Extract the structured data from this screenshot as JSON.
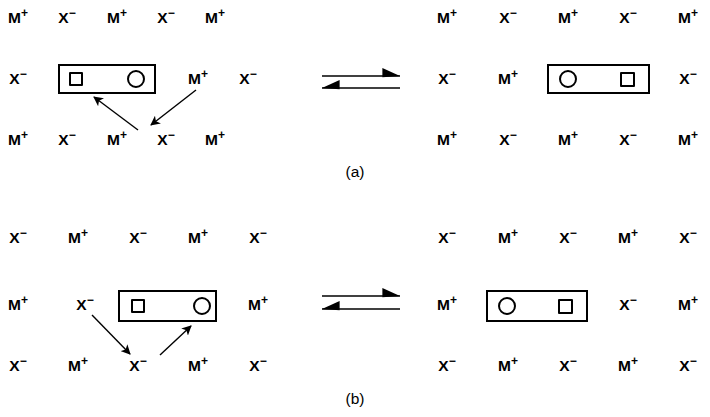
{
  "figure": {
    "background_color": "#ffffff",
    "ink_color": "#000000",
    "width": 710,
    "height": 417
  },
  "ions": {
    "cation": {
      "symbol": "M",
      "charge": "+",
      "label": "M+"
    },
    "anion": {
      "symbol": "X",
      "charge": "−",
      "label": "X−"
    }
  },
  "panels": [
    {
      "id": "a",
      "label": "(a)",
      "label_x": 355,
      "label_y": 172,
      "left_side": {
        "rows": [
          {
            "y": 18,
            "cells": [
              {
                "x": 18,
                "symbol": "M",
                "charge": "+"
              },
              {
                "x": 67,
                "symbol": "X",
                "charge": "−"
              },
              {
                "x": 117,
                "symbol": "M",
                "charge": "+"
              },
              {
                "x": 166,
                "symbol": "X",
                "charge": "−"
              },
              {
                "x": 215,
                "symbol": "M",
                "charge": "+"
              }
            ]
          },
          {
            "y": 79,
            "cells": [
              {
                "x": 18,
                "symbol": "X",
                "charge": "−"
              },
              {
                "x": 198,
                "symbol": "M",
                "charge": "+"
              },
              {
                "x": 248,
                "symbol": "X",
                "charge": "−"
              }
            ]
          },
          {
            "y": 140,
            "cells": [
              {
                "x": 18,
                "symbol": "M",
                "charge": "+"
              },
              {
                "x": 67,
                "symbol": "X",
                "charge": "−"
              },
              {
                "x": 117,
                "symbol": "M",
                "charge": "+"
              },
              {
                "x": 166,
                "symbol": "X",
                "charge": "−"
              },
              {
                "x": 215,
                "symbol": "M",
                "charge": "+"
              }
            ]
          }
        ],
        "host_box": {
          "x": 58,
          "y": 64,
          "w": 98,
          "h": 30
        },
        "guests": [
          {
            "shape": "square",
            "x": 69,
            "y": 72,
            "w": 14,
            "h": 14
          },
          {
            "shape": "circle",
            "x": 127,
            "y": 70,
            "w": 18,
            "h": 18
          }
        ],
        "arrows": [
          {
            "name": "cation-to-host-arrow",
            "x1": 138,
            "y1": 130,
            "x2": 94,
            "y2": 97
          },
          {
            "name": "cation-release-arrow",
            "x1": 196,
            "y1": 90,
            "x2": 151,
            "y2": 125
          }
        ]
      },
      "equilibrium_arrow": {
        "x": 322,
        "y_top": 76,
        "y_bottom": 88,
        "length": 78
      },
      "right_side": {
        "rows": [
          {
            "y": 18,
            "cells": [
              {
                "x": 447,
                "symbol": "M",
                "charge": "+"
              },
              {
                "x": 508,
                "symbol": "X",
                "charge": "−"
              },
              {
                "x": 568,
                "symbol": "M",
                "charge": "+"
              },
              {
                "x": 628,
                "symbol": "X",
                "charge": "−"
              },
              {
                "x": 688,
                "symbol": "M",
                "charge": "+"
              }
            ]
          },
          {
            "y": 79,
            "cells": [
              {
                "x": 447,
                "symbol": "X",
                "charge": "−"
              },
              {
                "x": 508,
                "symbol": "M",
                "charge": "+"
              },
              {
                "x": 688,
                "symbol": "X",
                "charge": "−"
              }
            ]
          },
          {
            "y": 140,
            "cells": [
              {
                "x": 447,
                "symbol": "M",
                "charge": "+"
              },
              {
                "x": 508,
                "symbol": "X",
                "charge": "−"
              },
              {
                "x": 568,
                "symbol": "M",
                "charge": "+"
              },
              {
                "x": 628,
                "symbol": "X",
                "charge": "−"
              },
              {
                "x": 688,
                "symbol": "M",
                "charge": "+"
              }
            ]
          }
        ],
        "host_box": {
          "x": 547,
          "y": 64,
          "w": 103,
          "h": 30
        },
        "guests": [
          {
            "shape": "circle",
            "x": 559,
            "y": 70,
            "w": 18,
            "h": 18
          },
          {
            "shape": "square",
            "x": 620,
            "y": 72,
            "w": 15,
            "h": 15
          }
        ],
        "arrows": []
      }
    },
    {
      "id": "b",
      "label": "(b)",
      "label_x": 355,
      "label_y": 399,
      "left_side": {
        "rows": [
          {
            "y": 238,
            "cells": [
              {
                "x": 18,
                "symbol": "X",
                "charge": "−"
              },
              {
                "x": 78,
                "symbol": "M",
                "charge": "+"
              },
              {
                "x": 138,
                "symbol": "X",
                "charge": "−"
              },
              {
                "x": 198,
                "symbol": "M",
                "charge": "+"
              },
              {
                "x": 258,
                "symbol": "X",
                "charge": "−"
              }
            ]
          },
          {
            "y": 305,
            "cells": [
              {
                "x": 18,
                "symbol": "M",
                "charge": "+"
              },
              {
                "x": 85,
                "symbol": "X",
                "charge": "−"
              },
              {
                "x": 258,
                "symbol": "M",
                "charge": "+"
              }
            ]
          },
          {
            "y": 366,
            "cells": [
              {
                "x": 18,
                "symbol": "X",
                "charge": "−"
              },
              {
                "x": 78,
                "symbol": "M",
                "charge": "+"
              },
              {
                "x": 138,
                "symbol": "X",
                "charge": "−"
              },
              {
                "x": 198,
                "symbol": "M",
                "charge": "+"
              },
              {
                "x": 258,
                "symbol": "X",
                "charge": "−"
              }
            ]
          }
        ],
        "host_box": {
          "x": 118,
          "y": 290,
          "w": 99,
          "h": 32
        },
        "guests": [
          {
            "shape": "square",
            "x": 131,
            "y": 299,
            "w": 14,
            "h": 14
          },
          {
            "shape": "circle",
            "x": 193,
            "y": 297,
            "w": 18,
            "h": 18
          }
        ],
        "arrows": [
          {
            "name": "anion-release-arrow",
            "x1": 92,
            "y1": 315,
            "x2": 130,
            "y2": 354
          },
          {
            "name": "anion-to-host-arrow",
            "x1": 160,
            "y1": 355,
            "x2": 191,
            "y2": 326
          }
        ]
      },
      "equilibrium_arrow": {
        "x": 322,
        "y_top": 296,
        "y_bottom": 309,
        "length": 78
      },
      "right_side": {
        "rows": [
          {
            "y": 238,
            "cells": [
              {
                "x": 447,
                "symbol": "X",
                "charge": "−"
              },
              {
                "x": 508,
                "symbol": "M",
                "charge": "+"
              },
              {
                "x": 568,
                "symbol": "X",
                "charge": "−"
              },
              {
                "x": 628,
                "symbol": "M",
                "charge": "+"
              },
              {
                "x": 688,
                "symbol": "X",
                "charge": "−"
              }
            ]
          },
          {
            "y": 305,
            "cells": [
              {
                "x": 447,
                "symbol": "M",
                "charge": "+"
              },
              {
                "x": 628,
                "symbol": "X",
                "charge": "−"
              },
              {
                "x": 688,
                "symbol": "M",
                "charge": "+"
              }
            ]
          },
          {
            "y": 366,
            "cells": [
              {
                "x": 447,
                "symbol": "X",
                "charge": "−"
              },
              {
                "x": 508,
                "symbol": "M",
                "charge": "+"
              },
              {
                "x": 568,
                "symbol": "X",
                "charge": "−"
              },
              {
                "x": 628,
                "symbol": "M",
                "charge": "+"
              },
              {
                "x": 688,
                "symbol": "X",
                "charge": "−"
              }
            ]
          }
        ],
        "host_box": {
          "x": 486,
          "y": 290,
          "w": 102,
          "h": 32
        },
        "guests": [
          {
            "shape": "circle",
            "x": 498,
            "y": 297,
            "w": 18,
            "h": 18
          },
          {
            "shape": "square",
            "x": 558,
            "y": 299,
            "w": 15,
            "h": 15
          }
        ],
        "arrows": []
      }
    }
  ]
}
